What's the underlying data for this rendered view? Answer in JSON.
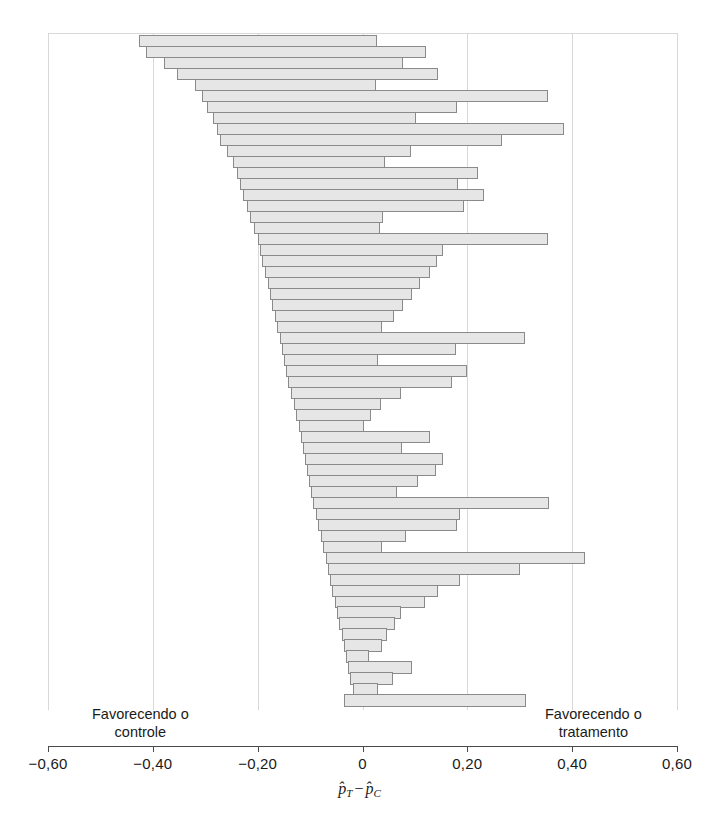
{
  "axis": {
    "xlabel_num": "p",
    "xlabel_sub1": "T",
    "xlabel_op": "−",
    "xlabel_num2": "p",
    "xlabel_sub2": "C",
    "ticks": [
      "-0,60",
      "-0,40",
      "-0,20",
      "0",
      "0,20",
      "0,40",
      "0,60"
    ],
    "tick_values": [
      -0.6,
      -0.4,
      -0.2,
      0,
      0.2,
      0.4,
      0.6
    ]
  },
  "annotations": {
    "favor_control_line1": "Favorecendo o",
    "favor_control_line2": "controle",
    "favor_treatment_line1": "Favorecendo o",
    "favor_treatment_line2": "tratamento"
  },
  "colors": {
    "bar_fill": "#e6e6e6",
    "bar_stroke": "#8a8a8a",
    "gridline": "#d8d8d8",
    "axis": "#4a4a4a",
    "text": "#1a1a1a",
    "background": "#ffffff"
  },
  "chart_data": {
    "type": "bar",
    "orientation": "horizontal",
    "title": "",
    "xlabel": "p̂_T − p̂_C",
    "ylabel": "",
    "xlim": [
      -0.6,
      0.6
    ],
    "xticks": [
      -0.6,
      -0.4,
      -0.2,
      0,
      0.2,
      0.4,
      0.6
    ],
    "xticklabels": [
      "-0,60",
      "-0,40",
      "-0,20",
      "0",
      "0,20",
      "0,40",
      "0,60"
    ],
    "grid": "vertical",
    "legend": "none",
    "series_name": "confidence intervals",
    "bars": [
      {
        "low": -0.427,
        "high": 0.028
      },
      {
        "low": -0.413,
        "high": 0.122
      },
      {
        "low": -0.379,
        "high": 0.078
      },
      {
        "low": -0.354,
        "high": 0.144
      },
      {
        "low": -0.32,
        "high": 0.026
      },
      {
        "low": -0.306,
        "high": 0.354
      },
      {
        "low": -0.297,
        "high": 0.18
      },
      {
        "low": -0.286,
        "high": 0.103
      },
      {
        "low": -0.277,
        "high": 0.385
      },
      {
        "low": -0.272,
        "high": 0.266
      },
      {
        "low": -0.258,
        "high": 0.092
      },
      {
        "low": -0.247,
        "high": 0.043
      },
      {
        "low": -0.24,
        "high": 0.22
      },
      {
        "low": -0.233,
        "high": 0.183
      },
      {
        "low": -0.228,
        "high": 0.232
      },
      {
        "low": -0.221,
        "high": 0.193
      },
      {
        "low": -0.215,
        "high": 0.04
      },
      {
        "low": -0.207,
        "high": 0.034
      },
      {
        "low": -0.2,
        "high": 0.354
      },
      {
        "low": -0.195,
        "high": 0.153
      },
      {
        "low": -0.191,
        "high": 0.143
      },
      {
        "low": -0.186,
        "high": 0.128
      },
      {
        "low": -0.18,
        "high": 0.11
      },
      {
        "low": -0.176,
        "high": 0.094
      },
      {
        "low": -0.172,
        "high": 0.078
      },
      {
        "low": -0.167,
        "high": 0.06
      },
      {
        "low": -0.163,
        "high": 0.037
      },
      {
        "low": -0.158,
        "high": 0.31
      },
      {
        "low": -0.154,
        "high": 0.178
      },
      {
        "low": -0.15,
        "high": 0.03
      },
      {
        "low": -0.146,
        "high": 0.2
      },
      {
        "low": -0.142,
        "high": 0.17
      },
      {
        "low": -0.137,
        "high": 0.074
      },
      {
        "low": -0.131,
        "high": 0.036
      },
      {
        "low": -0.127,
        "high": 0.017
      },
      {
        "low": -0.122,
        "high": 0.003
      },
      {
        "low": -0.118,
        "high": 0.128
      },
      {
        "low": -0.114,
        "high": 0.076
      },
      {
        "low": -0.11,
        "high": 0.154
      },
      {
        "low": -0.106,
        "high": 0.14
      },
      {
        "low": -0.102,
        "high": 0.105
      },
      {
        "low": -0.098,
        "high": 0.066
      },
      {
        "low": -0.094,
        "high": 0.355
      },
      {
        "low": -0.089,
        "high": 0.186
      },
      {
        "low": -0.085,
        "high": 0.18
      },
      {
        "low": -0.08,
        "high": 0.083
      },
      {
        "low": -0.075,
        "high": 0.037
      },
      {
        "low": -0.07,
        "high": 0.425
      },
      {
        "low": -0.066,
        "high": 0.3
      },
      {
        "low": -0.062,
        "high": 0.186
      },
      {
        "low": -0.058,
        "high": 0.144
      },
      {
        "low": -0.053,
        "high": 0.12
      },
      {
        "low": -0.049,
        "high": 0.073
      },
      {
        "low": -0.044,
        "high": 0.062
      },
      {
        "low": -0.04,
        "high": 0.046
      },
      {
        "low": -0.036,
        "high": 0.038
      },
      {
        "low": -0.032,
        "high": 0.013
      },
      {
        "low": -0.028,
        "high": 0.094
      },
      {
        "low": -0.024,
        "high": 0.058
      },
      {
        "low": -0.018,
        "high": 0.03
      },
      {
        "low": -0.036,
        "high": 0.312
      }
    ]
  }
}
